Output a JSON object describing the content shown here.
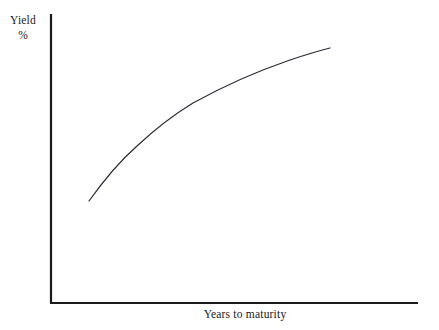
{
  "chart_data": {
    "type": "line",
    "title": "",
    "subtitle": "",
    "ylabel_line1": "Yield",
    "ylabel_line2": "%",
    "xlabel": "Years to maturity",
    "grid": false,
    "legend": "none",
    "annotations": [],
    "axis": {
      "x_ticklabels": [],
      "y_ticklabels": [],
      "xlim": [
        0,
        10
      ],
      "ylim": [
        0,
        10
      ],
      "x_axis_color": "#1a1a1a",
      "y_axis_color": "#1a1a1a"
    },
    "series": [
      {
        "name": "Yield curve",
        "color": "#2b2b33",
        "x": [
          1.0,
          1.5,
          2.0,
          2.5,
          3.0,
          3.5,
          4.0,
          4.5,
          5.0,
          5.5,
          6.0,
          6.5,
          7.0,
          7.5,
          7.9
        ],
        "y": [
          2.8,
          3.45,
          4.05,
          4.6,
          5.1,
          5.5,
          5.85,
          6.15,
          6.4,
          6.62,
          6.82,
          7.0,
          7.15,
          7.3,
          7.38
        ],
        "points_px": [
          [
            89,
            201
          ],
          [
            106,
            181
          ],
          [
            122,
            163
          ],
          [
            137,
            148
          ],
          [
            151,
            133
          ],
          [
            166,
            122
          ],
          [
            181,
            111
          ],
          [
            196,
            102
          ],
          [
            211,
            94
          ],
          [
            226,
            87
          ],
          [
            241,
            81
          ],
          [
            256,
            75
          ],
          [
            271,
            70
          ],
          [
            300,
            58
          ],
          [
            330,
            48
          ]
        ]
      }
    ],
    "curve_path_d": "M 89 201 C 104 180, 120 161, 137 146 C 152 132, 170 117, 193 103 C 222 87, 255 72, 290 60 C 305 55, 318 51, 330 48"
  },
  "colors": {
    "background": "#ffffff",
    "axis": "#1a1a1a",
    "curve": "#2b2b33"
  }
}
